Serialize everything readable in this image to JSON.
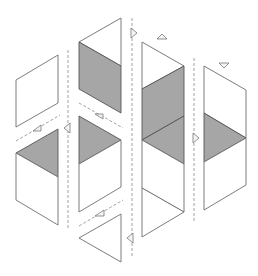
{
  "diagram": {
    "colors": {
      "white_face": "#ffffff",
      "gray_face": "#a6a6a6",
      "edge": "#6e6e6e",
      "fold_line": "#8a8a8a"
    },
    "columns": [
      {
        "id": "col-1",
        "faces": [
          {
            "shade": "white",
            "shape": "parallelogram",
            "points": "16,80 58,55 58,103 16,127"
          },
          {
            "shade": "gray",
            "shape": "triangle",
            "points": "16,153 58,129 58,177"
          },
          {
            "shade": "white",
            "shape": "parallelogram",
            "points": "16,153 58,177 58,225 16,200"
          }
        ]
      },
      {
        "id": "col-2",
        "faces": [
          {
            "shade": "white",
            "shape": "triangle",
            "points": "79,42 121,18 121,66"
          },
          {
            "shade": "gray",
            "shape": "parallelogram",
            "points": "79,42 121,66 121,113 79,89"
          },
          {
            "shade": "gray",
            "shape": "triangle",
            "points": "79,116 121,140 79,164"
          },
          {
            "shade": "white",
            "shape": "parallelogram",
            "points": "79,164 121,140 121,187 79,212"
          },
          {
            "shade": "white",
            "shape": "triangle",
            "points": "79,238 121,214 121,262"
          }
        ]
      },
      {
        "id": "col-3",
        "faces": [
          {
            "shade": "white",
            "shape": "triangle",
            "points": "142,42 184,66 142,89"
          },
          {
            "shade": "gray",
            "shape": "parallelogram",
            "points": "142,89 184,66 184,116 142,140"
          },
          {
            "shade": "gray",
            "shape": "triangle",
            "points": "142,140 184,116 184,164"
          },
          {
            "shade": "white",
            "shape": "parallelogram",
            "points": "142,140 184,164 184,212 142,188"
          },
          {
            "shade": "white",
            "shape": "triangle",
            "points": "142,188 184,212 142,237"
          }
        ]
      },
      {
        "id": "col-4",
        "faces": [
          {
            "shade": "white",
            "shape": "parallelogram",
            "points": "204,66 246,90 246,138 204,113"
          },
          {
            "shade": "gray",
            "shape": "triangle",
            "points": "204,113 246,138 204,162"
          },
          {
            "shade": "white",
            "shape": "parallelogram",
            "points": "204,162 246,138 246,185 204,210"
          }
        ]
      }
    ],
    "fold_lines": [
      {
        "id": "fold-v1",
        "x1": 68,
        "y1": 50,
        "x2": 68,
        "y2": 230
      },
      {
        "id": "fold-v2",
        "x1": 132,
        "y1": 18,
        "x2": 132,
        "y2": 258
      },
      {
        "id": "fold-v3",
        "x1": 194,
        "y1": 58,
        "x2": 194,
        "y2": 222
      },
      {
        "id": "fold-d1",
        "x1": 16,
        "y1": 141,
        "x2": 60,
        "y2": 115
      },
      {
        "id": "fold-d2",
        "x1": 79,
        "y1": 103,
        "x2": 123,
        "y2": 128
      },
      {
        "id": "fold-d3",
        "x1": 79,
        "y1": 226,
        "x2": 123,
        "y2": 200
      }
    ],
    "arrows": [
      {
        "id": "arrow-1",
        "direction": "left",
        "points": "64,128 70,123 70,133"
      },
      {
        "id": "arrow-2",
        "direction": "right",
        "points": "137,33 131,28 131,38"
      },
      {
        "id": "arrow-3",
        "direction": "left",
        "points": "127,238 133,233 133,243"
      },
      {
        "id": "arrow-4",
        "direction": "right",
        "points": "199,138 193,133 193,143"
      },
      {
        "id": "arrow-5",
        "direction": "up-left",
        "points": "33,131 41,125 41,131"
      },
      {
        "id": "arrow-6",
        "direction": "up-right",
        "points": "95,114 103,114 103,119"
      },
      {
        "id": "arrow-7",
        "direction": "up-left",
        "points": "95,216 104,210 104,216"
      },
      {
        "id": "arrow-8",
        "direction": "up",
        "points": "162,34 157,39 167,39"
      },
      {
        "id": "arrow-9",
        "direction": "down",
        "points": "224,68 219,63 229,63"
      }
    ]
  }
}
